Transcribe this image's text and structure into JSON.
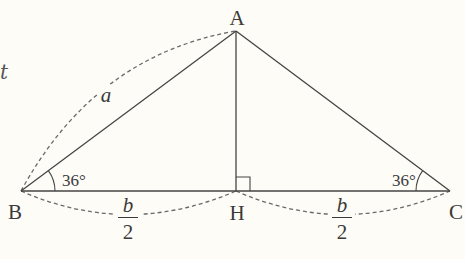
{
  "figure": {
    "type": "isosceles-triangle-with-altitude",
    "background_color": "#fdfcf7",
    "line_color": "#444444",
    "dashed_color": "#666666",
    "vertices": {
      "A": {
        "label": "A",
        "x": 236,
        "y": 31
      },
      "B": {
        "label": "B",
        "x": 21,
        "y": 191
      },
      "C": {
        "label": "C",
        "x": 450,
        "y": 191
      },
      "H": {
        "label": "H",
        "x": 236,
        "y": 191
      }
    },
    "angles": {
      "B": {
        "label": "36°"
      },
      "C": {
        "label": "36°"
      }
    },
    "right_angle_at": "H",
    "sides": {
      "AB": {
        "label": "a"
      },
      "BH": {
        "numerator": "b",
        "denominator": "2"
      },
      "HC": {
        "numerator": "b",
        "denominator": "2"
      }
    },
    "edge_fragment": "t"
  }
}
